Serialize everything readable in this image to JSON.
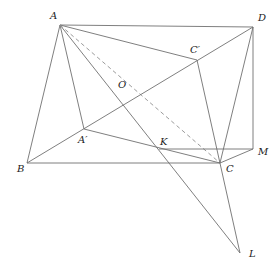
{
  "diagram": {
    "type": "geometry-figure",
    "stroke_color": "#707070",
    "dash_color": "#909090",
    "label_color": "#222222",
    "points": {
      "A": {
        "label": "A",
        "x": 60,
        "y": 25,
        "lx": 50,
        "ly": 19
      },
      "D": {
        "label": "D",
        "x": 253,
        "y": 27,
        "lx": 258,
        "ly": 21
      },
      "Cp": {
        "label": "C′",
        "x": 197,
        "y": 60,
        "lx": 190,
        "ly": 53
      },
      "O": {
        "label": "O",
        "x": 121,
        "y": 95,
        "lx": 118,
        "ly": 88
      },
      "Ap": {
        "label": "A′",
        "x": 84,
        "y": 129,
        "lx": 78,
        "ly": 143
      },
      "B": {
        "label": "B",
        "x": 27,
        "y": 163,
        "lx": 17,
        "ly": 172
      },
      "K": {
        "label": "K",
        "x": 159,
        "y": 149,
        "lx": 160,
        "ly": 145
      },
      "C": {
        "label": "C",
        "x": 220,
        "y": 163,
        "lx": 226,
        "ly": 172
      },
      "M": {
        "label": "M",
        "x": 253,
        "y": 149,
        "lx": 258,
        "ly": 155
      },
      "L": {
        "label": "L",
        "x": 240,
        "y": 253,
        "lx": 249,
        "ly": 257
      }
    },
    "segments": [
      {
        "from": "A",
        "to": "D",
        "style": "solid"
      },
      {
        "from": "A",
        "to": "B",
        "style": "solid"
      },
      {
        "from": "A",
        "to": "Ap",
        "style": "solid"
      },
      {
        "from": "A",
        "to": "Cp",
        "style": "solid"
      },
      {
        "from": "A",
        "to": "L",
        "style": "solid"
      },
      {
        "from": "A",
        "to": "C",
        "style": "dashed"
      },
      {
        "from": "B",
        "to": "D",
        "style": "solid"
      },
      {
        "from": "B",
        "to": "C",
        "style": "solid"
      },
      {
        "from": "D",
        "to": "M",
        "style": "solid"
      },
      {
        "from": "D",
        "to": "C",
        "style": "solid"
      },
      {
        "from": "Ap",
        "to": "C",
        "style": "solid"
      },
      {
        "from": "Cp",
        "to": "L",
        "style": "solid"
      },
      {
        "from": "K",
        "to": "M",
        "style": "solid"
      },
      {
        "from": "C",
        "to": "M",
        "style": "solid"
      }
    ]
  }
}
